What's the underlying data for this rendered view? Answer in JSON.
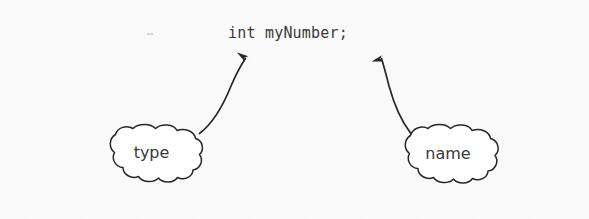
{
  "figure": {
    "kind": "annotated-code-diagram",
    "caption_absent": true,
    "background_color": "#fcfcfc",
    "ink_color": "#2b2b2b",
    "code_line": {
      "text": "int myNumber;",
      "tokens": [
        {
          "text": "int",
          "role": "type"
        },
        {
          "text": "myNumber",
          "role": "name"
        },
        {
          "text": ";",
          "role": "terminator"
        }
      ]
    },
    "callouts": [
      {
        "id": "type",
        "label": "type",
        "shape": "cloud",
        "points_to": "int",
        "arrow_direction": "up-right"
      },
      {
        "id": "name",
        "label": "name",
        "shape": "cloud",
        "points_to": "myNumber",
        "arrow_direction": "up-left"
      }
    ]
  }
}
